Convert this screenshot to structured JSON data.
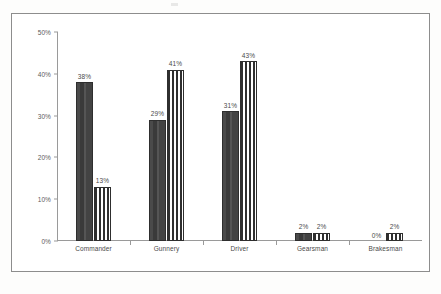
{
  "chart_data": {
    "type": "bar",
    "title": "",
    "subtitle": "",
    "xlabel": "",
    "ylabel": "",
    "ylim": [
      0,
      50
    ],
    "yticks": [
      "0%",
      "10%",
      "20%",
      "30%",
      "40%",
      "50%"
    ],
    "ytick_values": [
      0,
      10,
      20,
      30,
      40,
      50
    ],
    "grid": false,
    "legend": "none",
    "categories": [
      "Commander",
      "Gunnery",
      "Driver",
      "Gearsman",
      "Brakesman"
    ],
    "series": [
      {
        "name": "series-1",
        "pattern": "solid-dark",
        "values": [
          38,
          29,
          31,
          2,
          0
        ],
        "labels": [
          "38%",
          "29%",
          "31%",
          "2%",
          "0%"
        ]
      },
      {
        "name": "series-2",
        "pattern": "vertical-stripes",
        "values": [
          13,
          41,
          43,
          2,
          2
        ],
        "labels": [
          "13%",
          "41%",
          "43%",
          "2%",
          "2%"
        ]
      }
    ],
    "colors": {
      "series1_fill": "#3a3a3a",
      "series2_fill": "#2f2f2f",
      "series2_stripe": "#ffffff",
      "axis": "#9a9a9a",
      "frame": "#8d8d8d",
      "text": "#4a4a4a",
      "background": "#ffffff"
    }
  }
}
